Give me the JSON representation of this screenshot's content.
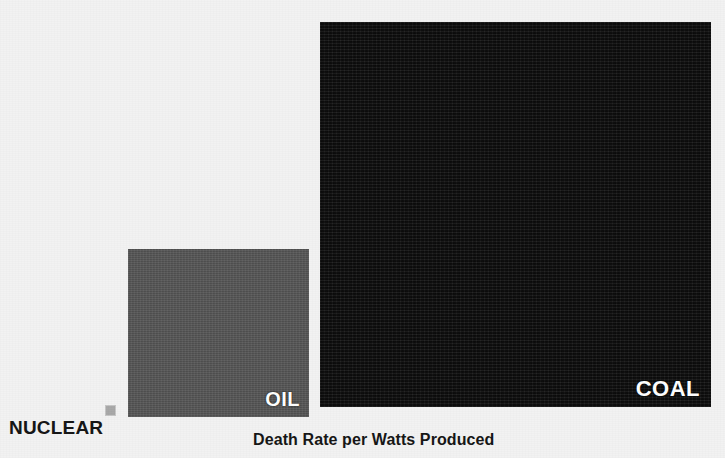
{
  "caption": "Death Rate per Watts Produced",
  "background_color": "#f2f2f2",
  "labels": {
    "nuclear": "NUCLEAR",
    "oil": "OIL",
    "coal": "COAL"
  },
  "chart_data": {
    "type": "bar",
    "title": "Death Rate per Watts Produced",
    "subtitle": "",
    "xlabel": "",
    "ylabel": "",
    "note": "Area-proportional squares: each square's area encodes the death rate per watts produced for that energy source.",
    "categories": [
      "NUCLEAR",
      "OIL",
      "COAL"
    ],
    "values": [
      81,
      30408,
      150535
    ],
    "value_units": "square area in px^2 (relative magnitude)",
    "relative_to_nuclear": [
      1,
      375,
      1858
    ],
    "colors": [
      "#a8a8a8",
      "#565656",
      "#141414"
    ],
    "square_sizes_px": [
      {
        "name": "NUCLEAR",
        "width": 9,
        "height": 9
      },
      {
        "name": "OIL",
        "width": 181,
        "height": 168
      },
      {
        "name": "COAL",
        "width": 391,
        "height": 385
      }
    ],
    "legend": "inline labels",
    "grid": false,
    "axis_visible": false
  }
}
